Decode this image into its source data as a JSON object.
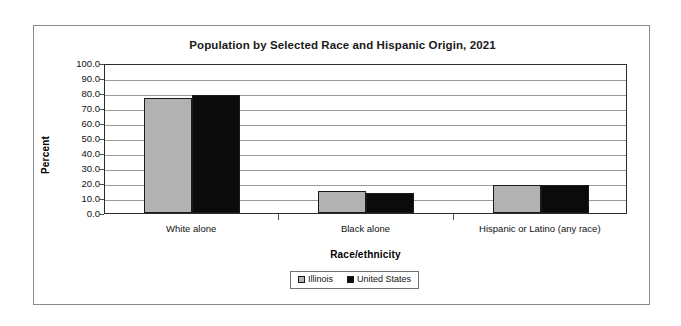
{
  "chart_data": {
    "type": "bar",
    "title": "Population by Selected Race and Hispanic Origin, 2021",
    "xlabel": "Race/ethnicity",
    "ylabel": "Percent",
    "ylim": [
      0,
      100
    ],
    "ytick_step": 10,
    "ytick_labels": [
      "100.0",
      "90.0",
      "80.0",
      "70.0",
      "60.0",
      "50.0",
      "40.0",
      "30.0",
      "20.0",
      "10.0",
      "0.0"
    ],
    "ytick_values": [
      100,
      90,
      80,
      70,
      60,
      50,
      40,
      30,
      20,
      10,
      0
    ],
    "grid": true,
    "legend_position": "bottom",
    "categories": [
      "White alone",
      "Black alone",
      "Hispanic or Latino (any race)"
    ],
    "series": [
      {
        "name": "Illinois",
        "color": "#b2b2b2",
        "values": [
          76.8,
          14.6,
          18.6
        ]
      },
      {
        "name": "United States",
        "color": "#0b0b0b",
        "values": [
          78.8,
          13.6,
          19.0
        ]
      }
    ]
  }
}
